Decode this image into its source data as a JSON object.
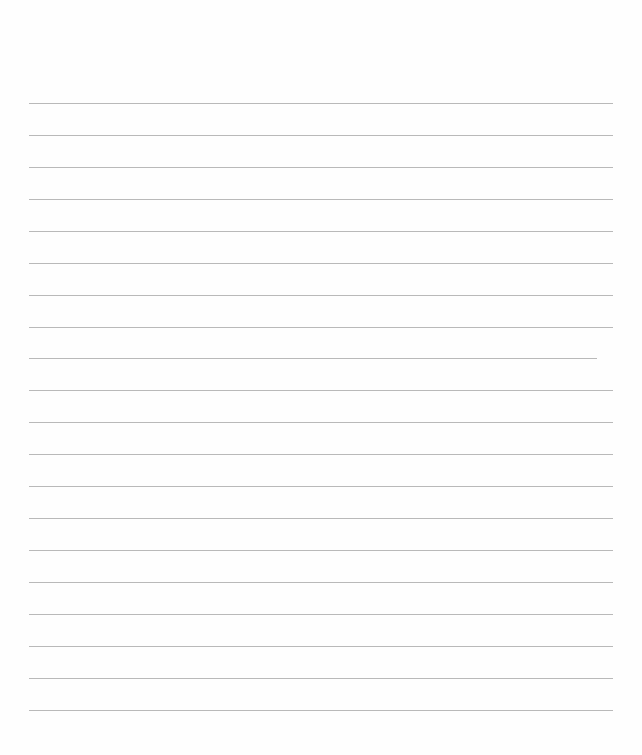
{
  "page": {
    "type": "ruled-paper",
    "background": "#fefefe",
    "line_color": "#b9b9b9",
    "line_spacing_px": 32,
    "lines": [
      {
        "y": 103,
        "x1": 29,
        "x2": 613
      },
      {
        "y": 135,
        "x1": 29,
        "x2": 613
      },
      {
        "y": 167,
        "x1": 29,
        "x2": 613
      },
      {
        "y": 199,
        "x1": 29,
        "x2": 613
      },
      {
        "y": 231,
        "x1": 29,
        "x2": 613
      },
      {
        "y": 263,
        "x1": 29,
        "x2": 613
      },
      {
        "y": 295,
        "x1": 29,
        "x2": 613
      },
      {
        "y": 327,
        "x1": 29,
        "x2": 613
      },
      {
        "y": 358,
        "x1": 29,
        "x2": 597
      },
      {
        "y": 390,
        "x1": 29,
        "x2": 613
      },
      {
        "y": 422,
        "x1": 29,
        "x2": 613
      },
      {
        "y": 454,
        "x1": 29,
        "x2": 613
      },
      {
        "y": 486,
        "x1": 29,
        "x2": 613
      },
      {
        "y": 518,
        "x1": 29,
        "x2": 613
      },
      {
        "y": 550,
        "x1": 29,
        "x2": 613
      },
      {
        "y": 582,
        "x1": 29,
        "x2": 613
      },
      {
        "y": 614,
        "x1": 29,
        "x2": 613
      },
      {
        "y": 646,
        "x1": 29,
        "x2": 613
      },
      {
        "y": 678,
        "x1": 29,
        "x2": 613
      },
      {
        "y": 710,
        "x1": 29,
        "x2": 613
      }
    ]
  }
}
